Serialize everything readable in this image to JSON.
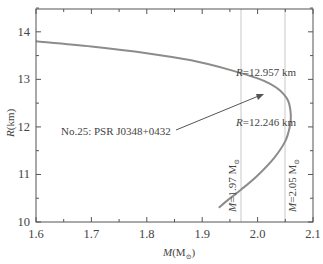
{
  "chart_data": {
    "type": "line",
    "title": "",
    "xlabel": "M(M⊙)",
    "ylabel": "R(km)",
    "xlim": [
      1.6,
      2.1
    ],
    "ylim": [
      10,
      14.48
    ],
    "x_ticks": [
      "1.6",
      "1.7",
      "1.8",
      "1.9",
      "2.0",
      "2.1"
    ],
    "y_ticks": [
      "10",
      "11",
      "12",
      "13",
      "14"
    ],
    "grid": false,
    "legend": null,
    "series": [
      {
        "name": "Mass-radius relation",
        "color": "#8c8c8c",
        "points": [
          [
            1.6,
            13.8
          ],
          [
            1.7,
            13.69
          ],
          [
            1.8,
            13.55
          ],
          [
            1.88,
            13.4
          ],
          [
            1.95,
            13.2
          ],
          [
            2.0,
            13.02
          ],
          [
            2.02,
            12.92
          ],
          [
            2.04,
            12.77
          ],
          [
            2.055,
            12.55
          ],
          [
            2.06,
            12.25
          ],
          [
            2.058,
            12.0
          ],
          [
            2.05,
            11.7
          ],
          [
            2.03,
            11.35
          ],
          [
            2.0,
            10.98
          ],
          [
            1.97,
            10.68
          ],
          [
            1.945,
            10.45
          ],
          [
            1.93,
            10.3
          ]
        ]
      }
    ],
    "vertical_lines": [
      {
        "x": 1.97,
        "label": "M=1.97 M⊙"
      },
      {
        "x": 2.05,
        "label": "M=2.05 M⊙"
      }
    ],
    "annotations": [
      {
        "text": "R=12.957 km",
        "x": 2.0,
        "y": 12.957
      },
      {
        "text": "R=12.246 km",
        "x": 2.0,
        "y": 12.246
      },
      {
        "text": "No.25: PSR J0348+0432",
        "arrow_to": [
          2.015,
          12.7
        ]
      }
    ]
  },
  "labels": {
    "xlabel_main": "M",
    "xlabel_unit_open": "(M",
    "xlabel_unit_sub": "⊙",
    "xlabel_unit_close": ")",
    "ylabel_main": "R",
    "ylabel_unit": "(km)",
    "r1_var": "R",
    "r1_val": "=12.957 km",
    "r2_var": "R",
    "r2_val": "=12.246 km",
    "pulsar": "No.25: PSR J0348+0432",
    "m1_var": "M",
    "m1_val": "=1.97 M",
    "m2_var": "M",
    "m2_val": "=2.05 M",
    "sun_symbol": "⊙"
  }
}
